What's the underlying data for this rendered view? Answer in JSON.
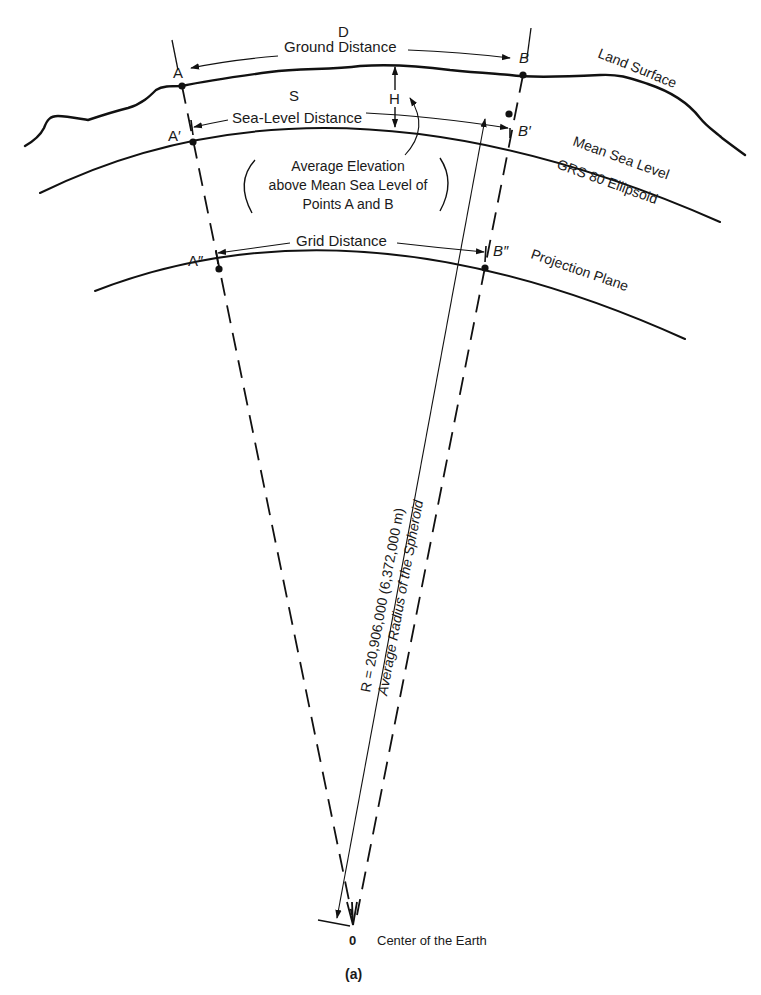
{
  "figure": {
    "caption": "(a)",
    "labels": {
      "D": "D",
      "ground_distance": "Ground Distance",
      "A": "A",
      "B": "B",
      "land_surface": "Land Surface",
      "S": "S",
      "sea_level_distance": "Sea-Level Distance",
      "H": "H",
      "A_prime": "A′",
      "B_prime": "B′",
      "mean_sea_level": "Mean Sea Level",
      "ellipsoid": "GRS 80 Ellipsoid",
      "avg_elev_line1": "Average Elevation",
      "avg_elev_line2": "above Mean Sea Level of",
      "avg_elev_line3": "Points A and B",
      "grid_distance": "Grid Distance",
      "A_double_prime": "A″",
      "B_double_prime": "B″",
      "projection_plane": "Projection Plane",
      "radius_line1": "R = 20,906,000 (6,372,000 m)",
      "radius_line2": "Average Radius of the Spheroid",
      "origin": "0",
      "center_of_earth": "Center of the Earth"
    }
  }
}
